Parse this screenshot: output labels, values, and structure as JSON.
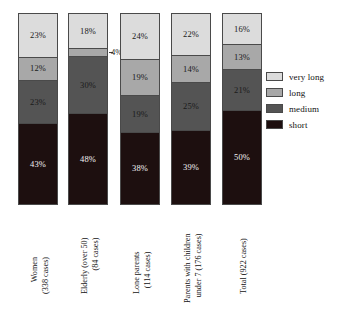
{
  "chart_data": {
    "type": "bar",
    "subtype": "stacked-percentage",
    "title": "",
    "subtitle": "",
    "xlabel": "",
    "ylabel": "",
    "ylim": [
      0,
      100
    ],
    "grid": false,
    "legend_position": "right",
    "orientation": "vertical",
    "categories": [
      "Women (338 cases)",
      "Elderly (over 50) (84 cases)",
      "Lone parents (114 cases)",
      "Parents with children under 7 (176 cases)",
      "Total (922 cases)"
    ],
    "category_lines": [
      [
        "Women",
        "(338 cases)"
      ],
      [
        "Elderly (over 50)",
        "(84 cases)"
      ],
      [
        "Lone parents",
        "(114 cases)"
      ],
      [
        "Parents with children",
        "under 7 (176 cases)"
      ],
      [
        "Total (922 cases)"
      ]
    ],
    "series": [
      {
        "name": "short",
        "color": "#1d0f0f",
        "values": [
          43,
          48,
          38,
          39,
          50
        ]
      },
      {
        "name": "medium",
        "color": "#545454",
        "values": [
          23,
          30,
          19,
          25,
          21
        ]
      },
      {
        "name": "long",
        "color": "#a8a8a8",
        "values": [
          12,
          4,
          19,
          14,
          13
        ]
      },
      {
        "name": "very long",
        "color": "#dcdcdc",
        "values": [
          23,
          18,
          24,
          22,
          16
        ]
      }
    ],
    "stack_order_top_to_bottom": [
      "very long",
      "long",
      "medium",
      "short"
    ]
  },
  "bars": [
    {
      "id": "women",
      "x": 18,
      "label_lines": [
        "Women",
        "(338 cases)"
      ],
      "label_x": 30,
      "label_y": 294,
      "segments": [
        {
          "key": "very-long",
          "label": "23%",
          "pct": 23,
          "outside": false
        },
        {
          "key": "long",
          "label": "12%",
          "pct": 12,
          "outside": false
        },
        {
          "key": "medium",
          "label": "23%",
          "pct": 23,
          "outside": false
        },
        {
          "key": "short",
          "label": "43%",
          "pct": 43,
          "outside": false
        }
      ]
    },
    {
      "id": "elderly",
      "x": 68,
      "label_lines": [
        "Elderly (over 50)",
        "(84 cases)"
      ],
      "label_x": 80,
      "label_y": 294,
      "segments": [
        {
          "key": "very-long",
          "label": "18%",
          "pct": 18,
          "outside": false
        },
        {
          "key": "long",
          "label": "4%",
          "pct": 4,
          "outside": true
        },
        {
          "key": "medium",
          "label": "30%",
          "pct": 30,
          "outside": false
        },
        {
          "key": "short",
          "label": "48%",
          "pct": 48,
          "outside": false
        }
      ]
    },
    {
      "id": "lone-parents",
      "x": 120,
      "label_lines": [
        "Lone parents",
        "(114 cases)"
      ],
      "label_x": 132,
      "label_y": 294,
      "segments": [
        {
          "key": "very-long",
          "label": "24%",
          "pct": 24,
          "outside": false
        },
        {
          "key": "long",
          "label": "19%",
          "pct": 19,
          "outside": false
        },
        {
          "key": "medium",
          "label": "19%",
          "pct": 19,
          "outside": false
        },
        {
          "key": "short",
          "label": "38%",
          "pct": 38,
          "outside": false
        }
      ]
    },
    {
      "id": "parents-children-under-7",
      "x": 171,
      "label_lines": [
        "Parents with children",
        "under 7 (176 cases)"
      ],
      "label_x": 183,
      "label_y": 303,
      "segments": [
        {
          "key": "very-long",
          "label": "22%",
          "pct": 22,
          "outside": false
        },
        {
          "key": "long",
          "label": "14%",
          "pct": 14,
          "outside": false
        },
        {
          "key": "medium",
          "label": "25%",
          "pct": 25,
          "outside": false
        },
        {
          "key": "short",
          "label": "39%",
          "pct": 39,
          "outside": false
        }
      ]
    },
    {
      "id": "total",
      "x": 222,
      "label_lines": [
        "Total (922 cases)"
      ],
      "label_x": 239,
      "label_y": 294,
      "segments": [
        {
          "key": "very-long",
          "label": "16%",
          "pct": 16,
          "outside": false
        },
        {
          "key": "long",
          "label": "13%",
          "pct": 13,
          "outside": false
        },
        {
          "key": "medium",
          "label": "21%",
          "pct": 21,
          "outside": false
        },
        {
          "key": "short",
          "label": "50%",
          "pct": 50,
          "outside": false
        }
      ]
    }
  ],
  "legend": {
    "items": [
      {
        "label": "very long",
        "color": "#dcdcdc"
      },
      {
        "label": "long",
        "color": "#a8a8a8"
      },
      {
        "label": "medium",
        "color": "#545454"
      },
      {
        "label": "short",
        "color": "#1d0f0f"
      }
    ]
  },
  "geometry": {
    "plot_top": 13,
    "plot_bottom": 205,
    "bar_width": 40
  },
  "colors": {
    "very_long": "#dcdcdc",
    "long": "#a8a8a8",
    "medium": "#545454",
    "short": "#1d0f0f",
    "outline": "#4a4a4a",
    "text": "#111111",
    "text_on_dark": "#f2f2f2",
    "background": "#ffffff"
  }
}
